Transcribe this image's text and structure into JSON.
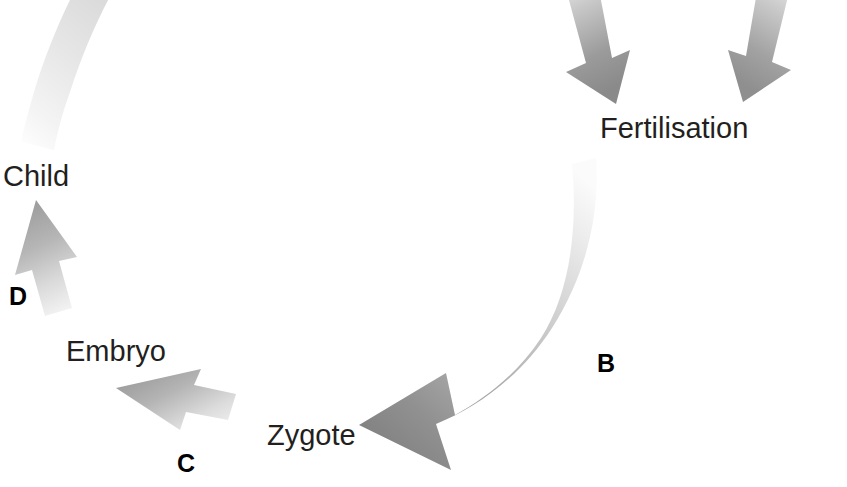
{
  "diagram": {
    "type": "cycle-flow",
    "background_color": "#ffffff",
    "labels": {
      "fertilisation": "Fertilisation",
      "child": "Child",
      "embryo": "Embryo",
      "zygote": "Zygote"
    },
    "step_letters": {
      "b": "B",
      "c": "C",
      "d": "D"
    },
    "colors": {
      "label_text": "#231f20",
      "letter_text": "#000000",
      "arrow_dark": "#7c7c7c",
      "arrow_mid": "#a8a8a8",
      "arrow_light": "#e8e8e8",
      "arrow_faint": "#f2f2f2"
    },
    "arrows": [
      {
        "name": "sperm-input-arrow",
        "direction": "down-right",
        "target": "Fertilisation",
        "gradient": "light-to-dark"
      },
      {
        "name": "egg-input-arrow",
        "direction": "down-left",
        "target": "Fertilisation",
        "gradient": "light-to-dark"
      },
      {
        "name": "arrow-b",
        "letter": "B",
        "from": "Fertilisation",
        "to": "Zygote",
        "direction": "curved-down-left",
        "gradient": "light-to-dark"
      },
      {
        "name": "arrow-c",
        "letter": "C",
        "from": "Zygote",
        "to": "Embryo",
        "direction": "up-left",
        "gradient": "light-to-dark"
      },
      {
        "name": "arrow-d",
        "letter": "D",
        "from": "Embryo",
        "to": "Child",
        "direction": "up",
        "gradient": "light-to-dark"
      },
      {
        "name": "arrow-a-tail",
        "from": "Child",
        "direction": "curved-up-right",
        "gradient": "faint",
        "note": "cropped at top edge"
      }
    ]
  }
}
